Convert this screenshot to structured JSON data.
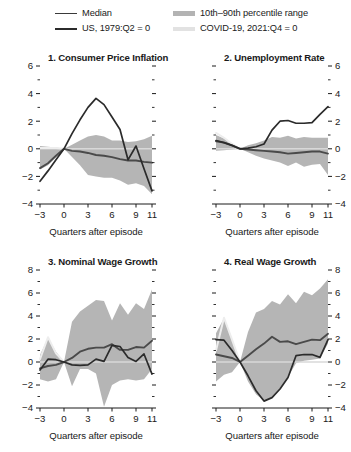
{
  "legend": {
    "entries": [
      {
        "id": "median",
        "label": "Median",
        "style": "line",
        "color": "#3a3a3a"
      },
      {
        "id": "band",
        "label": "10th–90th percentile range",
        "style": "band",
        "color": "#b3b3b3"
      },
      {
        "id": "us1979",
        "label": "US, 1979:Q2 = 0",
        "style": "line-thick",
        "color": "#2b2b2b"
      },
      {
        "id": "covid",
        "label": "COVID-19, 2021:Q4 = 0",
        "style": "band-light",
        "color": "#e2e2e2"
      }
    ]
  },
  "axis_caption": "Quarters after episode",
  "chart_data": [
    {
      "id": "panel-1",
      "type": "line",
      "title": "1. Consumer Price Inflation",
      "xlabel": "Quarters after episode",
      "ylabel": "",
      "xlim": [
        -3,
        11
      ],
      "ylim": [
        -4,
        6
      ],
      "yticks": [
        -4,
        -2,
        0,
        2,
        4,
        6
      ],
      "yticks_minor": [
        -3,
        -1,
        1,
        3,
        5
      ],
      "xticks": [
        -3,
        0,
        3,
        6,
        9,
        11
      ],
      "grid": false,
      "legend_position": "figure-top",
      "x": [
        -3,
        -2,
        -1,
        0,
        1,
        2,
        3,
        4,
        5,
        6,
        7,
        8,
        9,
        10,
        11
      ],
      "series": [
        {
          "name": "10th percentile",
          "role": "band-low",
          "values": [
            -1.5,
            -1.2,
            -0.6,
            0.0,
            -0.6,
            -1.2,
            -1.9,
            -2.0,
            -2.1,
            -2.1,
            -2.3,
            -2.6,
            -2.5,
            -2.7,
            -3.3
          ]
        },
        {
          "name": "90th percentile",
          "role": "band-high",
          "values": [
            0.2,
            0.15,
            0.1,
            0.0,
            0.3,
            0.6,
            0.9,
            1.0,
            0.9,
            0.6,
            0.6,
            0.5,
            0.55,
            0.7,
            0.95
          ]
        },
        {
          "name": "Median",
          "role": "median",
          "values": [
            -1.4,
            -1.05,
            -0.5,
            0.0,
            -0.15,
            -0.2,
            -0.3,
            -0.45,
            -0.5,
            -0.6,
            -0.75,
            -0.85,
            -0.85,
            -0.95,
            -1.0
          ]
        },
        {
          "name": "US, 1979:Q2 = 0",
          "role": "us1979",
          "values": [
            -2.35,
            -1.6,
            -0.8,
            0.0,
            1.1,
            2.1,
            3.0,
            3.65,
            3.2,
            2.3,
            1.4,
            -0.8,
            0.2,
            -1.45,
            -3.05
          ]
        },
        {
          "name": "COVID-19, 2021:Q4 = 0",
          "role": "covid",
          "values": [
            0.05,
            0.05,
            0.05,
            0.0,
            null,
            null,
            null,
            null,
            null,
            null,
            null,
            null,
            null,
            null,
            null
          ]
        }
      ]
    },
    {
      "id": "panel-2",
      "type": "line",
      "title": "2. Unemployment Rate",
      "xlabel": "Quarters after episode",
      "ylabel": "",
      "xlim": [
        -3,
        11
      ],
      "ylim": [
        -4,
        6
      ],
      "yticks": [
        -4,
        -2,
        0,
        2,
        4,
        6
      ],
      "yticks_minor": [
        -3,
        -1,
        1,
        3,
        5
      ],
      "xticks": [
        -3,
        0,
        3,
        6,
        9,
        11
      ],
      "grid": false,
      "legend_position": "figure-top",
      "x": [
        -3,
        -2,
        -1,
        0,
        1,
        2,
        3,
        4,
        5,
        6,
        7,
        8,
        9,
        10,
        11
      ],
      "series": [
        {
          "name": "10th percentile",
          "role": "band-low",
          "values": [
            -0.15,
            -0.1,
            -0.05,
            0.0,
            -0.25,
            -0.5,
            -0.7,
            -0.85,
            -1.0,
            -1.25,
            -1.0,
            -1.3,
            -1.15,
            -1.1,
            -1.9
          ]
        },
        {
          "name": "90th percentile",
          "role": "band-high",
          "values": [
            1.0,
            0.75,
            0.35,
            0.0,
            0.25,
            0.4,
            0.6,
            0.85,
            0.8,
            0.95,
            0.75,
            0.85,
            0.8,
            0.8,
            0.8
          ]
        },
        {
          "name": "Median",
          "role": "median",
          "values": [
            0.55,
            0.45,
            0.25,
            0.0,
            -0.05,
            -0.1,
            -0.15,
            -0.2,
            -0.25,
            -0.35,
            -0.3,
            -0.25,
            -0.2,
            -0.2,
            -0.35
          ]
        },
        {
          "name": "US, 1979:Q2 = 0",
          "role": "us1979",
          "values": [
            0.6,
            0.45,
            0.25,
            0.0,
            0.05,
            0.15,
            0.35,
            1.35,
            2.0,
            2.05,
            1.85,
            1.85,
            1.9,
            2.5,
            3.05
          ]
        },
        {
          "name": "COVID-19, 2021:Q4 = 0",
          "role": "covid",
          "values": [
            1.15,
            0.8,
            0.35,
            0.0,
            null,
            null,
            null,
            null,
            null,
            null,
            null,
            null,
            null,
            null,
            null
          ]
        }
      ]
    },
    {
      "id": "panel-3",
      "type": "line",
      "title": "3. Nominal Wage Growth",
      "xlabel": "Quarters after episode",
      "ylabel": "",
      "xlim": [
        -3,
        11
      ],
      "ylim": [
        -4,
        8
      ],
      "yticks": [
        -4,
        -2,
        0,
        2,
        4,
        6,
        8
      ],
      "yticks_minor": [
        -3,
        -1,
        1,
        3,
        5,
        7
      ],
      "xticks": [
        -3,
        0,
        3,
        6,
        9,
        11
      ],
      "grid": false,
      "legend_position": "figure-top",
      "x": [
        -3,
        -2,
        -1,
        0,
        1,
        2,
        3,
        4,
        5,
        6,
        7,
        8,
        9,
        10,
        11
      ],
      "series": [
        {
          "name": "10th percentile",
          "role": "band-low",
          "values": [
            -1.5,
            -1.7,
            -1.5,
            0.0,
            -2.1,
            -0.6,
            -0.6,
            -1.0,
            -3.9,
            -2.0,
            -1.6,
            -1.5,
            -1.6,
            -1.5,
            -0.6
          ]
        },
        {
          "name": "90th percentile",
          "role": "band-high",
          "values": [
            0.6,
            2.1,
            0.9,
            0.0,
            3.5,
            4.4,
            4.9,
            5.4,
            5.3,
            3.6,
            5.1,
            4.1,
            5.1,
            4.6,
            6.3
          ]
        },
        {
          "name": "Median",
          "role": "median",
          "values": [
            -0.55,
            -0.35,
            -0.25,
            0.0,
            0.35,
            0.9,
            1.15,
            1.25,
            1.25,
            1.55,
            1.05,
            1.05,
            1.3,
            1.25,
            1.85
          ]
        },
        {
          "name": "US, 1979:Q2 = 0",
          "role": "us1979",
          "values": [
            -0.7,
            0.25,
            0.2,
            0.0,
            -0.25,
            -0.3,
            -0.25,
            0.25,
            0.05,
            1.45,
            1.35,
            0.4,
            0.05,
            0.7,
            -1.05
          ]
        },
        {
          "name": "COVID-19, 2021:Q4 = 0",
          "role": "covid",
          "values": [
            0.25,
            2.15,
            0.75,
            0.0,
            null,
            null,
            null,
            null,
            null,
            null,
            null,
            null,
            null,
            null,
            null
          ]
        }
      ]
    },
    {
      "id": "panel-4",
      "type": "line",
      "title": "4. Real Wage Growth",
      "xlabel": "Quarters after episode",
      "ylabel": "",
      "xlim": [
        -3,
        11
      ],
      "ylim": [
        -4,
        8
      ],
      "yticks": [
        -4,
        -2,
        0,
        2,
        4,
        6,
        8
      ],
      "yticks_minor": [
        -3,
        -1,
        1,
        3,
        5,
        7
      ],
      "xticks": [
        -3,
        0,
        3,
        6,
        9,
        11
      ],
      "grid": false,
      "legend_position": "figure-top",
      "x": [
        -3,
        -2,
        -1,
        0,
        1,
        2,
        3,
        4,
        5,
        6,
        7,
        8,
        9,
        10,
        11
      ],
      "series": [
        {
          "name": "10th percentile",
          "role": "band-low",
          "values": [
            -1.7,
            -1.1,
            -0.9,
            0.0,
            -1.7,
            -2.8,
            -3.4,
            -3.1,
            -2.3,
            -1.3,
            -0.1,
            0.1,
            0.2,
            0.3,
            1.6
          ]
        },
        {
          "name": "90th percentile",
          "role": "band-high",
          "values": [
            2.5,
            3.8,
            2.0,
            0.0,
            2.6,
            4.3,
            4.6,
            5.3,
            5.0,
            5.9,
            5.1,
            6.1,
            5.8,
            6.4,
            7.2
          ]
        },
        {
          "name": "Median",
          "role": "median",
          "values": [
            0.65,
            0.5,
            0.35,
            0.0,
            0.55,
            1.1,
            1.6,
            2.2,
            1.75,
            1.8,
            1.55,
            1.75,
            1.95,
            1.9,
            2.45
          ]
        },
        {
          "name": "US, 1979:Q2 = 0",
          "role": "us1979",
          "values": [
            1.95,
            1.9,
            1.0,
            0.0,
            -1.2,
            -2.5,
            -3.4,
            -3.1,
            -2.35,
            -1.35,
            0.55,
            0.65,
            0.65,
            0.4,
            1.95
          ]
        },
        {
          "name": "COVID-19, 2021:Q4 = 0",
          "role": "covid",
          "values": [
            1.0,
            3.85,
            1.95,
            0.0,
            null,
            null,
            null,
            null,
            null,
            null,
            null,
            null,
            null,
            null,
            null
          ]
        }
      ]
    }
  ]
}
